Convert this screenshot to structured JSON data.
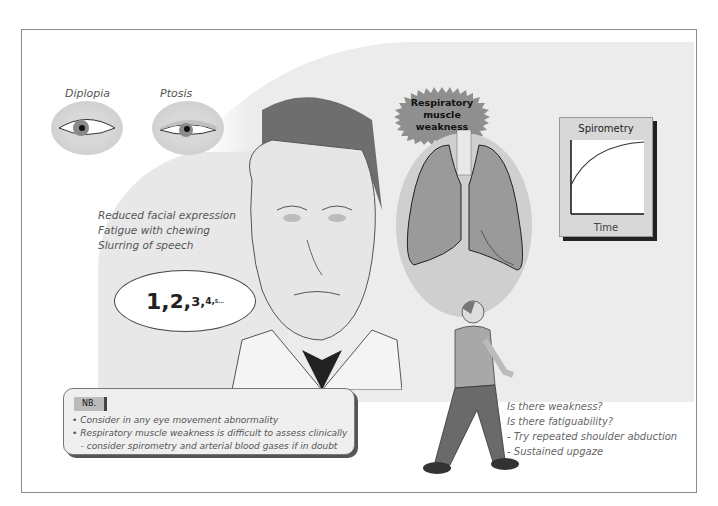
{
  "eyes": [
    {
      "label": "Diplopia"
    },
    {
      "label": "Ptosis"
    }
  ],
  "face_features": [
    "Reduced facial expression",
    "Fatigue with chewing",
    "Slurring of speech"
  ],
  "speech_bubble": {
    "counts": [
      "1,",
      "2,",
      "3,",
      "4,",
      "5..."
    ]
  },
  "respiratory": {
    "label_line1": "Respiratory muscle",
    "label_line2": "weakness"
  },
  "spirometry": {
    "title": "Spirometry",
    "x_label": "Time"
  },
  "nb": {
    "tag": "NB.",
    "lines": [
      "• Consider in any eye movement abnormality",
      "• Respiratory muscle weakness is difficult to assess clinically",
      "   - consider spirometry and arterial blood gases if in doubt"
    ]
  },
  "questions": [
    "Is there weakness?",
    "Is there fatiguability?",
    "- Try repeated shoulder abduction",
    "- Sustained upgaze"
  ]
}
